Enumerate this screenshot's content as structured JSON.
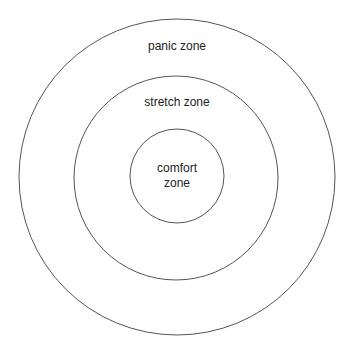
{
  "diagram": {
    "type": "concentric-circles",
    "stroke_color": "#555555",
    "zones": [
      {
        "id": "panic",
        "label": "panic zone"
      },
      {
        "id": "stretch",
        "label": "stretch zone"
      },
      {
        "id": "comfort",
        "label_line1": "comfort",
        "label_line2": "zone"
      }
    ]
  }
}
